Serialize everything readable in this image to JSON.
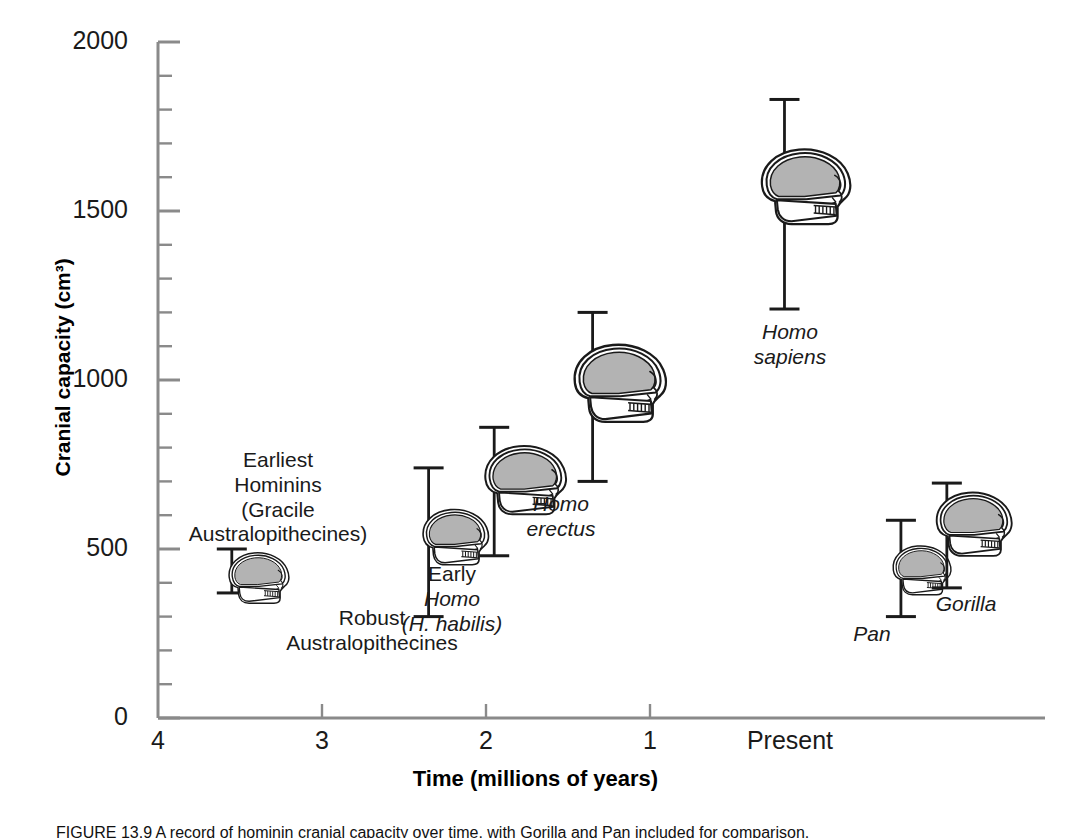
{
  "figure": {
    "caption": "FIGURE 13.9  A record of hominin cranial capacity over time, with Gorilla and Pan included for comparison."
  },
  "axes": {
    "y": {
      "title": "Cranial capacity (cm³)",
      "ticks": [
        0,
        500,
        1000,
        1500,
        2000
      ],
      "tick_labels": [
        "0",
        "500",
        "1000",
        "1500",
        "2000"
      ],
      "minor_step": 100,
      "range": [
        0,
        2000
      ]
    },
    "x": {
      "title": "Time (millions of years)",
      "tick_labels": [
        "4",
        "3",
        "2",
        "1",
        "Present"
      ],
      "tick_values": [
        4,
        3,
        2,
        1,
        0
      ],
      "range": [
        4,
        -0.9
      ]
    }
  },
  "chart_data": {
    "type": "scatter",
    "title": "",
    "xlabel": "Time (millions of years)",
    "ylabel": "Cranial capacity (cm³)",
    "xlim": [
      4,
      -0.9
    ],
    "ylim": [
      0,
      2000
    ],
    "grid": false,
    "legend": "none",
    "error_bars": "vertical range bars with caps",
    "points": [
      {
        "name": "Earliest Hominins (Gracile Australopithecines)",
        "label_lines": [
          "Earliest",
          "Hominins",
          "(Gracile",
          "Australopithecines)"
        ],
        "label_italic": [
          false,
          false,
          false,
          false
        ],
        "x_mya": 3.55,
        "y_low": 370,
        "y_high": 500,
        "y_mid": 435
      },
      {
        "name": "Robust Australopithecines",
        "label_lines": [
          "Robust",
          "Australopithecines"
        ],
        "label_italic": [
          false,
          false
        ],
        "x_mya": 2.35,
        "y_low": 300,
        "y_high": 740,
        "y_mid": 520
      },
      {
        "name": "Early Homo (H. habilis)",
        "label_lines": [
          "Early",
          "Homo",
          "(H. habilis)"
        ],
        "label_italic": [
          false,
          true,
          true
        ],
        "x_mya": 1.95,
        "y_low": 480,
        "y_high": 860,
        "y_mid": 670
      },
      {
        "name": "Homo erectus",
        "label_lines": [
          "Homo",
          "erectus"
        ],
        "label_italic": [
          true,
          true
        ],
        "x_mya": 1.35,
        "y_low": 700,
        "y_high": 1200,
        "y_mid": 950
      },
      {
        "name": "Homo sapiens",
        "label_lines": [
          "Homo",
          "sapiens"
        ],
        "label_italic": [
          true,
          true
        ],
        "x_mya": 0.18,
        "y_low": 1210,
        "y_high": 1830,
        "y_mid": 1520
      },
      {
        "name": "Pan",
        "label_lines": [
          "Pan"
        ],
        "label_italic": [
          true
        ],
        "x_mya": -0.53,
        "y_low": 300,
        "y_high": 585,
        "y_mid": 440
      },
      {
        "name": "Gorilla",
        "label_lines": [
          "Gorilla"
        ],
        "label_italic": [
          true
        ],
        "x_mya": -0.81,
        "y_low": 385,
        "y_high": 695,
        "y_mid": 540
      }
    ]
  },
  "colors": {
    "axis": "#8a8a8a",
    "errorbar": "#1a1a1a",
    "skull_fill": "#ffffff",
    "cranium_fill": "#b3b3b3",
    "outline": "#1a1a1a",
    "text": "#1a1a1a",
    "background": "#ffffff"
  }
}
